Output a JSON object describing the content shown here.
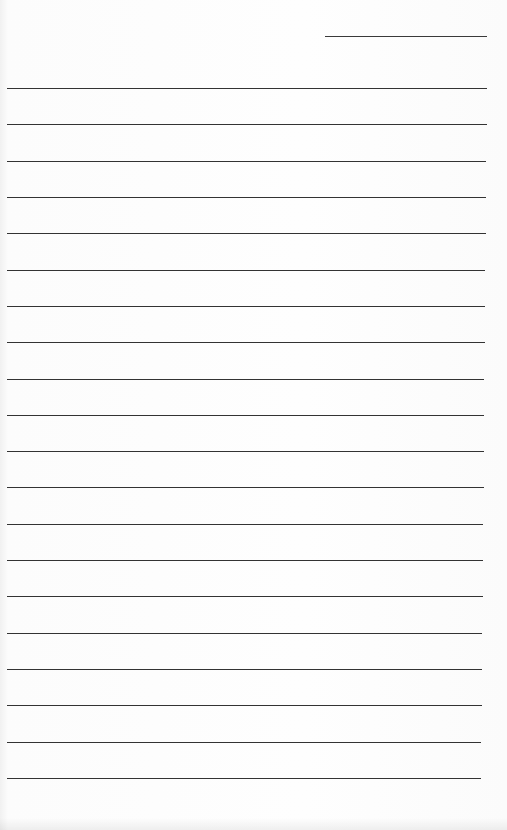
{
  "document": {
    "type": "lined-paper",
    "header_line": {
      "label": ""
    },
    "ruled_lines": 20,
    "line_color": "#333333",
    "background_color": "#fdfdfd"
  }
}
